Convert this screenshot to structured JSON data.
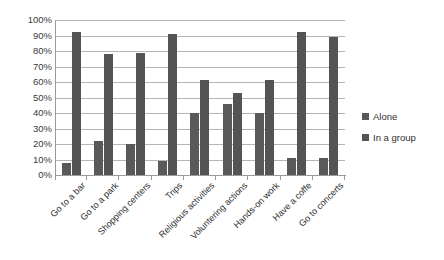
{
  "chart_data": {
    "type": "bar",
    "title": "",
    "subtitle": "",
    "xlabel": "",
    "ylabel": "",
    "ylim": [
      0,
      100
    ],
    "yticks": [
      "0%",
      "10%",
      "20%",
      "30%",
      "40%",
      "50%",
      "60%",
      "70%",
      "80%",
      "90%",
      "100%"
    ],
    "ytick_values": [
      0,
      10,
      20,
      30,
      40,
      50,
      60,
      70,
      80,
      90,
      100
    ],
    "grid": true,
    "legend_position": "right",
    "categories": [
      "Go to a bar",
      "Go to a park",
      "Shopping centers",
      "Trips",
      "Religious activities",
      "Voluntering actions",
      "Hands-on work",
      "Have a coffe",
      "Go to concerts"
    ],
    "series": [
      {
        "name": "Alone",
        "color": "#595959",
        "values": [
          8,
          22,
          20,
          9,
          40,
          46,
          40,
          11,
          11
        ]
      },
      {
        "name": "In a group",
        "color": "#545454",
        "values": [
          92,
          78,
          79,
          91,
          61,
          53,
          61,
          92,
          89
        ]
      }
    ]
  },
  "legend": {
    "items": [
      {
        "label": "Alone"
      },
      {
        "label": "In a group"
      }
    ]
  }
}
